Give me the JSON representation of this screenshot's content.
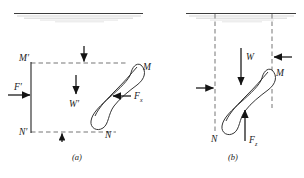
{
  "figure": {
    "background_color": "#ffffff",
    "ink_color": "#1a1a1a",
    "dashed_color": "#5c5c5c",
    "width": 304,
    "height": 178
  },
  "panels": [
    {
      "id": "a",
      "caption": "(a)",
      "labels": {
        "corner_top_left": "M′",
        "corner_bottom_left": "N′",
        "body_top_right": "M",
        "body_bottom_right": "N",
        "force_left": "F′",
        "force_weight": "W′",
        "force_right_base": "F",
        "force_right_sub": "x"
      },
      "arrows": [
        {
          "name": "applied-force-left",
          "label": "F′",
          "direction": "right"
        },
        {
          "name": "weight-arrow",
          "label": "W′",
          "direction": "down"
        },
        {
          "name": "top-reaction-arrow",
          "label": "",
          "direction": "down"
        },
        {
          "name": "bottom-reaction-arrow",
          "label": "",
          "direction": "up"
        },
        {
          "name": "horizontal-force-arrow",
          "label": "Fx",
          "direction": "left"
        }
      ]
    },
    {
      "id": "b",
      "caption": "(b)",
      "labels": {
        "body_top_right": "M",
        "body_bottom_left": "N",
        "force_weight": "W",
        "force_up_base": "F",
        "force_up_sub": "z"
      },
      "arrows": [
        {
          "name": "weight-arrow",
          "label": "W",
          "direction": "down"
        },
        {
          "name": "right-reaction-arrow",
          "label": "",
          "direction": "left"
        },
        {
          "name": "left-reaction-arrow",
          "label": "",
          "direction": "right"
        },
        {
          "name": "vertical-force-arrow",
          "label": "Fz",
          "direction": "up"
        }
      ]
    }
  ]
}
